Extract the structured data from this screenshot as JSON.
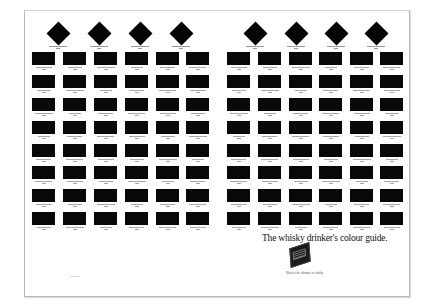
{
  "ad": {
    "headline": "The whisky drinker's colour guide.",
    "caption": "Black is the ultimate in whisky.",
    "colors": {
      "background": "#ffffff",
      "swatch": "#080808",
      "border": "#b8b8b8"
    }
  },
  "diamonds": {
    "left_centers_x": [
      58,
      99,
      140,
      181
    ],
    "right_centers_x": [
      255,
      296,
      336,
      376
    ],
    "center_y": 33,
    "count": 8
  },
  "swatch_grid": {
    "left_block_x": [
      32,
      63,
      94,
      125,
      156,
      186
    ],
    "right_block_x": [
      227,
      258,
      289,
      319,
      350,
      380
    ],
    "rows_y": [
      52,
      75,
      98,
      121,
      144,
      166,
      189,
      212
    ],
    "columns_per_block": 6,
    "rows": 8
  }
}
